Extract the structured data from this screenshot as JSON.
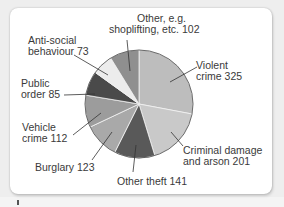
{
  "chart_data": {
    "type": "pie",
    "title": "",
    "start_angle_deg": 0,
    "direction": "clockwise",
    "total": 1162,
    "slices": [
      {
        "label": "Violent crime",
        "value": 325,
        "color": "#bdbdbd"
      },
      {
        "label": "Criminal damage and arson",
        "value": 201,
        "color": "#c9c9c9"
      },
      {
        "label": "Other theft",
        "value": 141,
        "color": "#595959"
      },
      {
        "label": "Burglary",
        "value": 123,
        "color": "#a9a9a9"
      },
      {
        "label": "Vehicle crime",
        "value": 112,
        "color": "#9c9c9c"
      },
      {
        "label": "Public order",
        "value": 85,
        "color": "#4a4a4a"
      },
      {
        "label": "Anti-social behaviour",
        "value": 73,
        "color": "#ececec"
      },
      {
        "label": "Other, e.g. shoplifting, etc.",
        "value": 102,
        "color": "#8f8f8f"
      }
    ]
  },
  "labels": {
    "violent": {
      "line1": "Violent",
      "line2": "crime 325"
    },
    "criminal": {
      "line1": "Criminal damage",
      "line2": "and arson 201"
    },
    "other_theft": {
      "line1": "Other theft 141"
    },
    "burglary": {
      "line1": "Burglary 123"
    },
    "vehicle": {
      "line1": "Vehicle",
      "line2": "crime 112"
    },
    "public": {
      "line1": "Public",
      "line2": "order 85"
    },
    "antisocial": {
      "line1": "Anti-social",
      "line2": "behaviour 73"
    },
    "other": {
      "line1": "Other, e.g.",
      "line2": "shoplifting, etc. 102"
    }
  }
}
